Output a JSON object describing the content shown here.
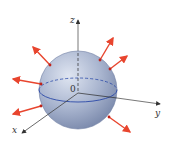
{
  "diagram": {
    "labels": {
      "z": "z",
      "y": "y",
      "x": "x",
      "origin": "0"
    },
    "colors": {
      "sphere_fill_light": "#c9d2e4",
      "sphere_fill_dark": "#7f8fb0",
      "equator": "#2b4aa8",
      "axis": "#444444",
      "normal_vector": "#e8452e",
      "background": "#ffffff"
    },
    "normal_vectors": [
      {
        "name": "upper-left",
        "from": [
          50,
          65
        ],
        "to": [
          33,
          47
        ]
      },
      {
        "name": "upper-right-1",
        "from": [
          100,
          60
        ],
        "to": [
          113,
          38
        ]
      },
      {
        "name": "upper-right-2",
        "from": [
          110,
          69
        ],
        "to": [
          127,
          56
        ]
      },
      {
        "name": "left-mid",
        "from": [
          41,
          84
        ],
        "to": [
          13,
          79
        ]
      },
      {
        "name": "left-low",
        "from": [
          41,
          106
        ],
        "to": [
          13,
          114
        ]
      },
      {
        "name": "lower-right",
        "from": [
          109,
          117
        ],
        "to": [
          130,
          132
        ]
      }
    ]
  }
}
